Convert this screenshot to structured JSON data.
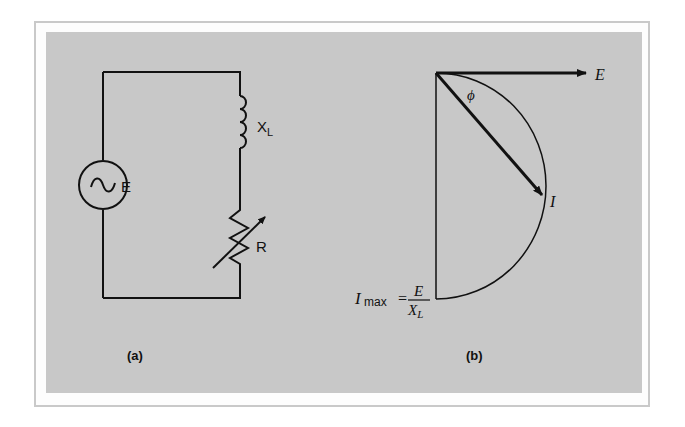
{
  "figure": {
    "panel_a": {
      "caption": "(a)",
      "source_label": "E",
      "inductor_label": "X",
      "inductor_subscript": "L",
      "resistor_label": "R"
    },
    "panel_b": {
      "caption": "(b)",
      "voltage_label": "E",
      "current_label": "I",
      "angle_label": "ϕ",
      "imax_label": "I",
      "imax_subscript": "max",
      "equals": "=",
      "fraction_numerator": "E",
      "fraction_denominator": "X",
      "fraction_denominator_subscript": "L"
    },
    "colors": {
      "panel_background": "#c8c8c8",
      "frame_border": "#c9c9c9",
      "ink": "#111111"
    }
  }
}
